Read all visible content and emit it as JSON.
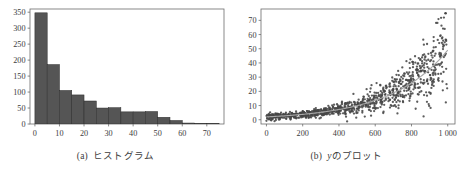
{
  "figure": {
    "panels": [
      {
        "id": "histogram",
        "caption_label": "(a)",
        "caption_text": "ヒストグラム"
      },
      {
        "id": "scatter",
        "caption_label": "(b)",
        "caption_var": "y",
        "caption_text": "のプロット"
      }
    ]
  },
  "style": {
    "bar_fill": "#555555",
    "bar_stroke": "#2b2b2b",
    "axis_color": "#6b6b6b",
    "point_color": "#474747",
    "trend_color": "#a8a8a8",
    "text_color": "#3c3c3c",
    "plot_bg": "#ffffff"
  },
  "chart_data": [
    {
      "type": "bar",
      "id": "histogram",
      "title": "",
      "subtitle": "",
      "xlabel": "",
      "ylabel": "",
      "grid": false,
      "legend": "none",
      "bin_width": 5,
      "bin_starts": [
        0,
        5,
        10,
        15,
        20,
        25,
        30,
        35,
        40,
        45,
        50,
        55,
        60,
        65,
        70
      ],
      "categories": [
        "0-5",
        "5-10",
        "10-15",
        "15-20",
        "20-25",
        "25-30",
        "30-35",
        "35-40",
        "40-45",
        "45-50",
        "50-55",
        "55-60",
        "60-65",
        "65-70",
        "70-75"
      ],
      "values": [
        348,
        186,
        105,
        91,
        72,
        50,
        51,
        38,
        38,
        39,
        21,
        11,
        3,
        2,
        2
      ],
      "xlim": [
        -2,
        77
      ],
      "ylim": [
        0,
        360
      ],
      "xticks": [
        0,
        10,
        20,
        30,
        40,
        50,
        60,
        70
      ],
      "xtick_labels": [
        "0",
        "10",
        "20",
        "30",
        "40",
        "50",
        "60",
        "70"
      ],
      "yticks": [
        0,
        50,
        100,
        150,
        200,
        250,
        300,
        350
      ],
      "ytick_labels": [
        "0",
        "50",
        "100",
        "150",
        "200",
        "250",
        "300",
        "350"
      ]
    },
    {
      "type": "scatter",
      "id": "scatter",
      "title": "",
      "subtitle": "",
      "xlabel": "",
      "ylabel": "",
      "grid": false,
      "legend": "none",
      "xlim": [
        -30,
        1040
      ],
      "ylim": [
        -3,
        78
      ],
      "xticks": [
        0,
        200,
        400,
        600,
        800,
        1000
      ],
      "xtick_labels": [
        "0",
        "200",
        "400",
        "600",
        "800",
        "1 000"
      ],
      "yticks": [
        0,
        10,
        20,
        30,
        40,
        50,
        60,
        70
      ],
      "ytick_labels": [
        "0",
        "10",
        "20",
        "30",
        "40",
        "50",
        "60",
        "70"
      ],
      "n_points": 1000,
      "trend": {
        "name": "exponential fit",
        "form": "a*exp(b*x)",
        "a": 2.0,
        "b": 0.0032,
        "x_from": 0,
        "x_to": 1000
      },
      "noise": {
        "model": "proportional",
        "sd_fraction": 0.3,
        "sd_floor": 1.1
      },
      "outliers": [
        {
          "x": 988,
          "y": 75
        }
      ],
      "series": [
        {
          "name": "y",
          "x_range": [
            0,
            1000
          ],
          "description": "exponentially increasing cloud with variance growing with x"
        }
      ]
    }
  ]
}
